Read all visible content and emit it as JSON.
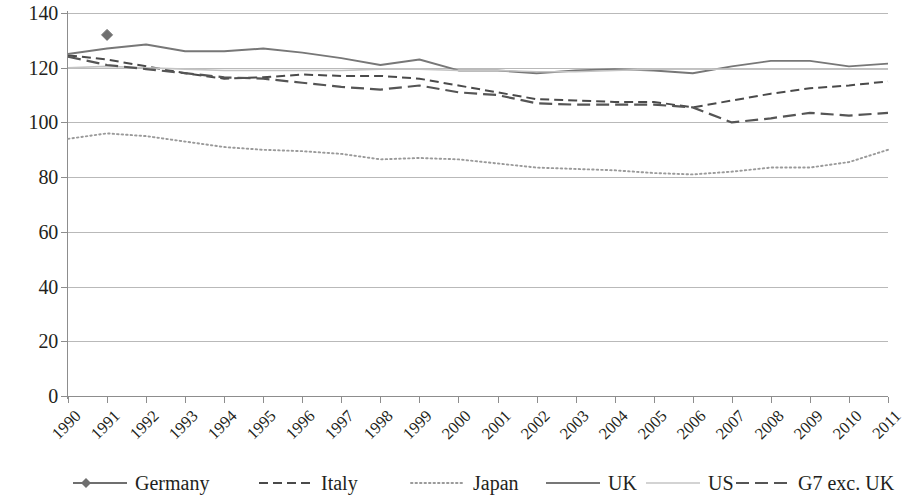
{
  "chart_data": {
    "type": "line",
    "title": "",
    "subtitle": "",
    "xlabel": "",
    "ylabel": "",
    "xlim": [
      1990,
      2011
    ],
    "ylim": [
      0,
      140
    ],
    "ytick_step": 20,
    "grid": true,
    "legend_position": "bottom",
    "categories": [
      "1990",
      "1991",
      "1992",
      "1993",
      "1994",
      "1995",
      "1996",
      "1997",
      "1998",
      "1999",
      "2000",
      "2001",
      "2002",
      "2003",
      "2004",
      "2005",
      "2006",
      "2007",
      "2008",
      "2009",
      "2010",
      "2011"
    ],
    "yticks": [
      0,
      20,
      40,
      60,
      80,
      100,
      120,
      140
    ],
    "ytick_labels": [
      "0",
      "20",
      "40",
      "60",
      "80",
      "100",
      "120",
      "140"
    ],
    "series": [
      {
        "name": "Germany",
        "style": "solid-marker",
        "color": "#6f6f6f",
        "marker": "diamond",
        "x": [
          "1991"
        ],
        "values": [
          132.0
        ]
      },
      {
        "name": "Italy",
        "style": "dashed",
        "color": "#4a4a4a",
        "x": [
          "1990",
          "1991",
          "1992",
          "1993",
          "1994",
          "1995",
          "1996",
          "1997",
          "1998",
          "1999",
          "2000",
          "2001",
          "2002",
          "2003",
          "2004",
          "2005",
          "2006",
          "2007",
          "2008",
          "2009",
          "2010",
          "2011"
        ],
        "values": [
          124.5,
          123.0,
          120.5,
          118.0,
          116.0,
          116.5,
          117.5,
          117.0,
          117.0,
          116.0,
          113.5,
          111.0,
          108.5,
          108.0,
          107.5,
          107.5,
          105.5,
          108.0,
          110.5,
          112.5,
          113.5,
          115.0
        ]
      },
      {
        "name": "Japan",
        "style": "dotted",
        "color": "#9a9a9a",
        "x": [
          "1990",
          "1991",
          "1992",
          "1993",
          "1994",
          "1995",
          "1996",
          "1997",
          "1998",
          "1999",
          "2000",
          "2001",
          "2002",
          "2003",
          "2004",
          "2005",
          "2006",
          "2007",
          "2008",
          "2009",
          "2010",
          "2011"
        ],
        "values": [
          94.0,
          96.0,
          95.0,
          93.0,
          91.0,
          90.0,
          89.5,
          88.5,
          86.5,
          87.0,
          86.5,
          85.0,
          83.5,
          83.0,
          82.5,
          81.5,
          81.0,
          82.0,
          83.5,
          83.5,
          85.5,
          90.0
        ]
      },
      {
        "name": "UK",
        "style": "solid",
        "color": "#777777",
        "x": [
          "1990",
          "1991",
          "1992",
          "1993",
          "1994",
          "1995",
          "1996",
          "1997",
          "1998",
          "1999",
          "2000",
          "2001",
          "2002",
          "2003",
          "2004",
          "2005",
          "2006",
          "2007",
          "2008",
          "2009",
          "2010",
          "2011"
        ],
        "values": [
          125.0,
          127.0,
          128.5,
          126.0,
          126.0,
          127.0,
          125.5,
          123.5,
          121.0,
          123.0,
          119.0,
          119.0,
          118.0,
          119.0,
          119.5,
          119.0,
          118.0,
          120.5,
          122.5,
          122.5,
          120.5,
          121.5
        ]
      },
      {
        "name": "US",
        "style": "solid-faint",
        "color": "#c4c4c4",
        "x": [
          "1990",
          "1991",
          "1992",
          "1993",
          "1994",
          "1995",
          "1996",
          "1997",
          "1998",
          "1999",
          "2000",
          "2001",
          "2002",
          "2003",
          "2004",
          "2005",
          "2006",
          "2007",
          "2008",
          "2009",
          "2010",
          "2011"
        ],
        "values": [
          120.0,
          120.5,
          120.0,
          119.5,
          119.0,
          119.0,
          119.0,
          119.0,
          119.5,
          119.5,
          119.0,
          119.0,
          118.5,
          118.5,
          119.0,
          119.5,
          119.5,
          119.5,
          119.5,
          119.5,
          119.5,
          119.5
        ]
      },
      {
        "name": "G7 exc. UK",
        "style": "dashed-long",
        "color": "#555555",
        "x": [
          "1990",
          "1991",
          "1992",
          "1993",
          "1994",
          "1995",
          "1996",
          "1997",
          "1998",
          "1999",
          "2000",
          "2001",
          "2002",
          "2003",
          "2004",
          "2005",
          "2006",
          "2007",
          "2008",
          "2009",
          "2010",
          "2011"
        ],
        "values": [
          124.0,
          121.0,
          119.5,
          118.0,
          116.5,
          116.0,
          114.5,
          113.0,
          112.0,
          113.5,
          111.0,
          110.0,
          107.0,
          106.5,
          106.5,
          106.5,
          105.5,
          100.0,
          101.5,
          103.5,
          102.5,
          103.5
        ]
      }
    ]
  },
  "legend": {
    "items": [
      {
        "label": "Germany",
        "swatch": "line-diamond-swatch"
      },
      {
        "label": "Italy",
        "swatch": "dashed-line-swatch"
      },
      {
        "label": "Japan",
        "swatch": "dotted-line-swatch"
      },
      {
        "label": "UK",
        "swatch": "solid-line-swatch"
      },
      {
        "label": "US",
        "swatch": "faint-line-swatch"
      },
      {
        "label": "G7 exc. UK",
        "swatch": "dashed-long-line-swatch"
      }
    ]
  }
}
